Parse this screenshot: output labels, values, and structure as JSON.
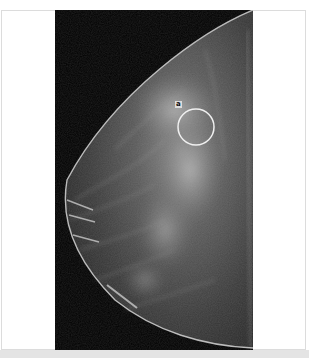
{
  "image": {
    "type": "mammogram",
    "view": "craniocaudal-like, breast facing left",
    "background_color": "#ffffff",
    "film_color": "#000000",
    "frame_border_color": "#dcdcdc",
    "bottom_strip_color": "#e4e4e4"
  },
  "annotation": {
    "shape": "circle",
    "stroke_color": "#f0f0f0",
    "center": [
      196,
      127
    ],
    "radius": 18,
    "label": "a"
  }
}
